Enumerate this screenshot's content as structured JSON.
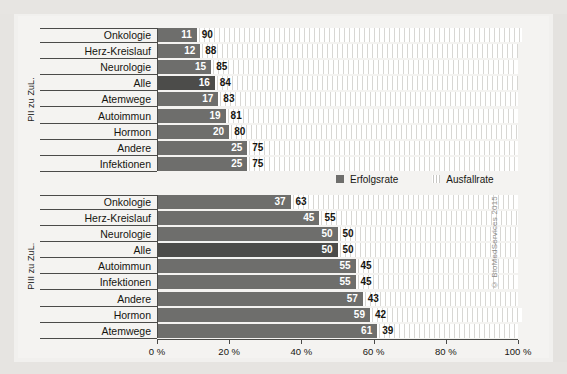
{
  "chart_data": {
    "type": "bar",
    "title": "",
    "subtitle": "",
    "orientation": "horizontal",
    "stacked": true,
    "xlabel": "",
    "ylabel": "",
    "xlim": [
      0,
      100
    ],
    "grid": false,
    "legend_position": "middle-right",
    "legend": [
      {
        "name": "Erfolgsrate",
        "color": "#6e6e6c",
        "pattern": "solid"
      },
      {
        "name": "Ausfallrate",
        "color": "#ffffff",
        "pattern": "vertical-hatch"
      }
    ],
    "x_ticks": [
      0,
      20,
      40,
      60,
      80,
      100
    ],
    "x_tick_labels": [
      "0 %",
      "20 %",
      "40 %",
      "60 %",
      "80 %",
      "100 %"
    ],
    "annotations": [
      "© BioMedServices 2015"
    ],
    "groups": [
      {
        "axis_title": "PII zu ZuL.",
        "categories": [
          "Onkologie",
          "Herz-Kreislauf",
          "Neurologie",
          "Alle",
          "Atemwege",
          "Autoimmun",
          "Hormon",
          "Andere",
          "Infektionen"
        ],
        "highlight_category": "Alle",
        "series": [
          {
            "name": "Erfolgsrate",
            "values": [
              11,
              12,
              15,
              16,
              17,
              19,
              20,
              25,
              25
            ]
          },
          {
            "name": "Ausfallrate",
            "values": [
              90,
              88,
              85,
              84,
              83,
              81,
              80,
              75,
              75
            ]
          }
        ]
      },
      {
        "axis_title": "PIII zu ZuL.",
        "categories": [
          "Onkologie",
          "Herz-Kreislauf",
          "Neurologie",
          "Alle",
          "Autoimmun",
          "Infektionen",
          "Andere",
          "Hormon",
          "Atemwege"
        ],
        "highlight_category": "Alle",
        "series": [
          {
            "name": "Erfolgsrate",
            "values": [
              37,
              45,
              50,
              50,
              55,
              55,
              57,
              59,
              61
            ]
          },
          {
            "name": "Ausfallrate",
            "values": [
              63,
              55,
              50,
              50,
              45,
              45,
              43,
              42,
              39
            ]
          }
        ]
      }
    ]
  },
  "colors": {
    "bar_success": "#6e6e6c",
    "bar_success_highlight": "#4c4c4a",
    "bar_fail": "#ffffff",
    "hatch": "#d8d7d4",
    "axis": "#4b4b49",
    "text": "#15140f",
    "background": "#f4f3f1",
    "page_background": "#f1f0ee"
  },
  "copyright": "© BioMedServices 2015"
}
